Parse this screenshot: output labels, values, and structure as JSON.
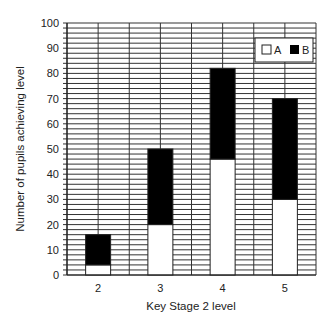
{
  "chart_data": {
    "type": "bar",
    "stacked": true,
    "title": "",
    "xlabel": "Key Stage 2 level",
    "ylabel": "Number of pupils achieving level",
    "categories": [
      "2",
      "3",
      "4",
      "5"
    ],
    "series": [
      {
        "name": "A",
        "color": "#ffffff",
        "values": [
          4,
          20,
          46,
          30
        ]
      },
      {
        "name": "B",
        "color": "#000000",
        "values": [
          12,
          30,
          36,
          40
        ]
      }
    ],
    "totals": [
      16,
      50,
      82,
      70
    ],
    "ylim": [
      0,
      100
    ],
    "yticks": [
      0,
      10,
      20,
      30,
      40,
      50,
      60,
      70,
      80,
      90,
      100
    ],
    "minor_grid_step": 2,
    "grid": true,
    "legend_position": "top-right, inside plot"
  },
  "legend": {
    "items": [
      {
        "label": "A"
      },
      {
        "label": "B"
      }
    ]
  }
}
